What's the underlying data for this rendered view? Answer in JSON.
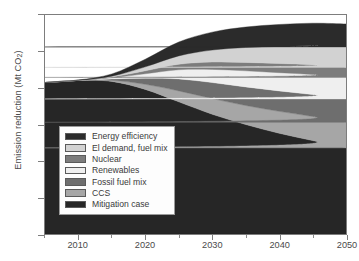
{
  "axes": {
    "ylabel_text": "Emission reduction (Mt CO",
    "ylabel_sub": "2",
    "ylabel_tail": ")",
    "yticks": [
      "0",
      "1000",
      "2000",
      "3000",
      "4000",
      "5000",
      "6000"
    ],
    "xticks": [
      "2010",
      "2020",
      "2030",
      "2040",
      "2050"
    ]
  },
  "legend": {
    "items": [
      {
        "label": "Energy efficiency",
        "color": "#2b2b2b"
      },
      {
        "label": "El demand, fuel mix",
        "color": "#d2d2d2"
      },
      {
        "label": "Nuclear",
        "color": "#7c7c7c"
      },
      {
        "label": "Renewables",
        "color": "#efefef"
      },
      {
        "label": "Fossil fuel mix",
        "color": "#6e6e6e"
      },
      {
        "label": "CCS",
        "color": "#a6a6a6"
      },
      {
        "label": "Mitigation case",
        "color": "#262626"
      }
    ]
  },
  "chart_data": {
    "type": "area",
    "title": "",
    "xlabel": "",
    "ylabel": "Emission reduction (Mt CO2)",
    "xlim": [
      2005,
      2050
    ],
    "ylim": [
      0,
      6000
    ],
    "grid": false,
    "stacked": true,
    "legend_position": "inside-bottom-left",
    "x": [
      2005,
      2010,
      2015,
      2020,
      2025,
      2030,
      2035,
      2040,
      2045,
      2050
    ],
    "series": [
      {
        "name": "Mitigation case",
        "color": "#262626",
        "values": [
          4150,
          4210,
          4180,
          3960,
          3620,
          3280,
          3000,
          2760,
          2560,
          2360
        ]
      },
      {
        "name": "CCS",
        "color": "#a6a6a6",
        "values": [
          0,
          0,
          30,
          140,
          300,
          430,
          520,
          600,
          660,
          700
        ]
      },
      {
        "name": "Fossil fuel mix",
        "color": "#6e6e6e",
        "values": [
          0,
          0,
          40,
          170,
          330,
          440,
          510,
          560,
          600,
          640
        ]
      },
      {
        "name": "Renewables",
        "color": "#efefef",
        "values": [
          0,
          0,
          30,
          120,
          250,
          360,
          440,
          500,
          550,
          590
        ]
      },
      {
        "name": "Nuclear",
        "color": "#7c7c7c",
        "values": [
          0,
          0,
          20,
          80,
          150,
          200,
          230,
          250,
          265,
          275
        ]
      },
      {
        "name": "El demand, fuel mix",
        "color": "#d2d2d2",
        "values": [
          0,
          0,
          25,
          110,
          230,
          330,
          410,
          470,
          520,
          560
        ]
      },
      {
        "name": "Energy efficiency",
        "color": "#2b2b2b",
        "values": [
          0,
          10,
          60,
          210,
          380,
          490,
          560,
          600,
          620,
          630
        ]
      }
    ],
    "totals": [
      4150,
      4220,
      4385,
      4790,
      5260,
      5530,
      5670,
      5740,
      5775,
      5755
    ]
  }
}
